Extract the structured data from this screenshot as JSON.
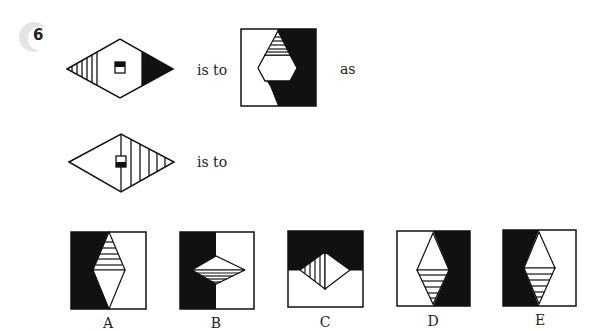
{
  "question": {
    "number": "6",
    "phrases": {
      "is_to_1": "is to",
      "as": "as",
      "is_to_2": "is to"
    }
  },
  "figures": {
    "source_1": {
      "description": "horizontal diamond with vertical hatched left tip, black right tip, small square marker top half black",
      "icon": "diamond-figure"
    },
    "target_1": {
      "description": "square split white/black with hexagon, horizontally hatched top triangle",
      "icon": "square-hexagon-figure"
    },
    "source_2": {
      "description": "horizontal diamond with center vertical line, vertical hatching on right half, small square marker bottom half black",
      "icon": "diamond-figure"
    }
  },
  "options": [
    {
      "label": "A",
      "description": "black left/white right, vertical diamond with hatched top half"
    },
    {
      "label": "B",
      "description": "black left/white right, horizontal diamond with hatched bottom half"
    },
    {
      "label": "C",
      "description": "black top/white bottom, diamond with vertical hatched left half"
    },
    {
      "label": "D",
      "description": "white left/black right, vertical diamond with hatched bottom half"
    },
    {
      "label": "E",
      "description": "black left/white right, vertical diamond with hatched bottom half"
    }
  ],
  "colors": {
    "ink": "#111111",
    "paper": "#ffffff",
    "badge": "#e4e4e4"
  }
}
